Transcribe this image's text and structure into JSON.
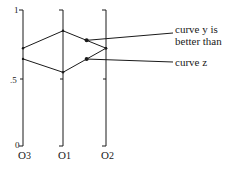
{
  "diagram": {
    "type": "parallel-axes-comparison",
    "y_ticks": [
      {
        "label": "1",
        "value": 1
      },
      {
        "label": ".5",
        "value": 0.5
      },
      {
        "label": "0",
        "value": 0
      }
    ],
    "axes": [
      {
        "id": "O3",
        "label": "O3",
        "name": "O",
        "subscript": "3"
      },
      {
        "id": "O1",
        "label": "O1",
        "name": "O",
        "subscript": "1"
      },
      {
        "id": "O2",
        "label": "O2",
        "name": "O",
        "subscript": "2"
      }
    ],
    "curves": [
      {
        "id": "y",
        "name": "curve y",
        "values": {
          "O3": 0.73,
          "O1": 0.86,
          "O2": 0.73
        }
      },
      {
        "id": "z",
        "name": "curve z",
        "values": {
          "O3": 0.65,
          "O1": 0.55,
          "O2": 0.73
        }
      }
    ],
    "annotations": [
      {
        "target": "y",
        "text_line1": "curve y is",
        "text_line2": "better than"
      },
      {
        "target": "z",
        "text_line1": "curve z"
      }
    ],
    "line_color": "#1a1a1a"
  }
}
